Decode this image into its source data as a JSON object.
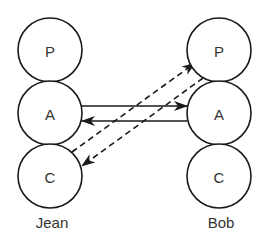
{
  "diagram": {
    "people": [
      {
        "name": "Jean",
        "label_pos": {
          "x": 52,
          "y": 228
        },
        "nodes": [
          {
            "label": "P",
            "cx": 50,
            "cy": 50,
            "r": 32
          },
          {
            "label": "A",
            "cx": 50,
            "cy": 113,
            "r": 32
          },
          {
            "label": "C",
            "cx": 50,
            "cy": 176,
            "r": 32
          }
        ]
      },
      {
        "name": "Bob",
        "label_pos": {
          "x": 221,
          "y": 228
        },
        "nodes": [
          {
            "label": "P",
            "cx": 219,
            "cy": 50,
            "r": 32
          },
          {
            "label": "A",
            "cx": 219,
            "cy": 113,
            "r": 32
          },
          {
            "label": "C",
            "cx": 219,
            "cy": 176,
            "r": 32
          }
        ]
      }
    ],
    "edges": [
      {
        "from": "Jean.A",
        "to": "Bob.A",
        "style": "solid",
        "x1": 82,
        "y1": 106,
        "x2": 187,
        "y2": 106
      },
      {
        "from": "Bob.A",
        "to": "Jean.A",
        "style": "solid",
        "x1": 187,
        "y1": 121,
        "x2": 82,
        "y2": 121
      },
      {
        "from": "Jean.C",
        "to": "Bob.P",
        "style": "dashed",
        "x1": 72,
        "y1": 152,
        "x2": 195,
        "y2": 63
      },
      {
        "from": "Bob.P",
        "to": "Jean.C",
        "style": "dashed",
        "x1": 203,
        "y1": 78,
        "x2": 82,
        "y2": 166
      }
    ],
    "colors": {
      "stroke": "#1a1a1a",
      "text": "#333333",
      "background": "#ffffff"
    }
  }
}
